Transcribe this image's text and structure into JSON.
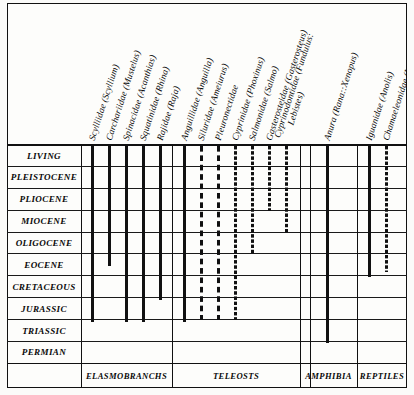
{
  "figure": {
    "type": "range-chart",
    "ink_color": "#111111",
    "paper_color": "#fdfdfb"
  },
  "rows": [
    {
      "id": "living",
      "label": "LIVING"
    },
    {
      "id": "pleistocene",
      "label": "PLEISTOCENE"
    },
    {
      "id": "pliocene",
      "label": "PLIOCENE"
    },
    {
      "id": "miocene",
      "label": "MIOCENE"
    },
    {
      "id": "oligocene",
      "label": "OLIGOCENE"
    },
    {
      "id": "eocene",
      "label": "EOCENE"
    },
    {
      "id": "cretaceous",
      "label": "CRETACEOUS"
    },
    {
      "id": "jurassic",
      "label": "JURASSIC"
    },
    {
      "id": "triassic",
      "label": "TRIASSIC"
    },
    {
      "id": "permian",
      "label": "PERMIAN"
    }
  ],
  "groups": [
    {
      "id": "elasmobranchs",
      "label": "ELASMOBRANCHS",
      "left": 81,
      "right": 172
    },
    {
      "id": "teleosts",
      "label": "TELEOSTS",
      "left": 172,
      "right": 300
    },
    {
      "id": "amphibia",
      "label": "AMPHIBIA",
      "left": 300,
      "right": 357
    },
    {
      "id": "reptiles",
      "label": "REPTILES",
      "left": 357,
      "right": 407
    }
  ],
  "taxa": [
    {
      "id": "scylliidae",
      "line1": "Scylliidae (Scyllium)",
      "line2": "",
      "x": 91,
      "group": "elasmobranchs",
      "style": "solid",
      "top": 146,
      "bottom": 322
    },
    {
      "id": "carchariidae",
      "line1": "Carchariidae (Mustelus)",
      "line2": "",
      "x": 108,
      "group": "elasmobranchs",
      "style": "solid",
      "top": 146,
      "bottom": 266
    },
    {
      "id": "spinacidae",
      "line1": "Spinacidae (Acanthias)",
      "line2": "",
      "x": 125,
      "group": "elasmobranchs",
      "style": "solid",
      "top": 146,
      "bottom": 322
    },
    {
      "id": "squatinidae",
      "line1": "Squatinidae (Rhina)",
      "line2": "",
      "x": 142,
      "group": "elasmobranchs",
      "style": "solid",
      "top": 146,
      "bottom": 322
    },
    {
      "id": "rajidae",
      "line1": "Rajidae (Raja)",
      "line2": "",
      "x": 159,
      "group": "elasmobranchs",
      "style": "solid",
      "top": 146,
      "bottom": 300
    },
    {
      "id": "anguillidae",
      "line1": "Anguillidae (Anguilla)",
      "line2": "",
      "x": 183,
      "group": "teleosts",
      "style": "solid",
      "top": 146,
      "bottom": 322
    },
    {
      "id": "siluridae",
      "line1": "Siluridae (Ameiurus)",
      "line2": "",
      "x": 200,
      "group": "teleosts",
      "style": "dashed-wide",
      "top": 146,
      "bottom": 320
    },
    {
      "id": "pleuronectidae",
      "line1": "Pleuronectidae",
      "line2": "",
      "x": 217,
      "group": "teleosts",
      "style": "dashed-wide",
      "top": 146,
      "bottom": 320
    },
    {
      "id": "cyprinidae",
      "line1": "Cyprinidae (Phoxinus)",
      "line2": "",
      "x": 234,
      "group": "teleosts",
      "style": "dashed",
      "top": 146,
      "bottom": 320
    },
    {
      "id": "salmonidae",
      "line1": "Salmonidae (Salmo)",
      "line2": "",
      "x": 251,
      "group": "teleosts",
      "style": "dashed",
      "top": 146,
      "bottom": 254
    },
    {
      "id": "gasterosteidae",
      "line1": "Gasterosteidae (Gasterosteus)",
      "line2": "",
      "x": 268,
      "group": "teleosts",
      "style": "dashed",
      "top": 146,
      "bottom": 211
    },
    {
      "id": "cyprinodontidae",
      "line1": "Cyprinodontidae (Fundulus:",
      "line2": "Lebistes)",
      "x": 285,
      "group": "teleosts",
      "style": "dashed",
      "top": 146,
      "bottom": 234
    },
    {
      "id": "anura",
      "line1": "Anura (Rana::Xenopus)",
      "line2": "",
      "x": 326,
      "group": "amphibia",
      "style": "solid",
      "top": 146,
      "bottom": 343
    },
    {
      "id": "iguanidae",
      "line1": "Iguanidae (Anolis)",
      "line2": "",
      "x": 368,
      "group": "reptiles",
      "style": "solid",
      "top": 146,
      "bottom": 277
    },
    {
      "id": "chamaeleonidae",
      "line1": "Chamaeleonidae (Lophosaura)",
      "line2": "",
      "x": 385,
      "group": "reptiles",
      "style": "dashed",
      "top": 146,
      "bottom": 272
    }
  ],
  "column_rules": [
    {
      "id": "elasmo-right",
      "x": 172
    },
    {
      "id": "teleost-right",
      "x": 300
    },
    {
      "id": "amphibia-right",
      "x": 357
    },
    {
      "id": "blank-1",
      "x": 172
    },
    {
      "id": "blank-2",
      "x": 310
    },
    {
      "id": "blank-3",
      "x": 357
    }
  ],
  "chart_data": {
    "type": "range-bars",
    "title": "",
    "xlabel": "",
    "ylabel": "Geological epoch",
    "categories": [
      "LIVING",
      "PLEISTOCENE",
      "PLIOCENE",
      "MIOCENE",
      "OLIGOCENE",
      "EOCENE",
      "CRETACEOUS",
      "JURASSIC",
      "TRIASSIC",
      "PERMIAN"
    ],
    "legend": [
      "solid = known fossil record",
      "dashed = inferred / fragmentary record"
    ],
    "series": [
      {
        "name": "Scylliidae (Scyllium)",
        "group": "ELASMOBRANCHS",
        "style": "solid",
        "from": "LIVING",
        "to": "CRETACEOUS"
      },
      {
        "name": "Carchariidae (Mustelus)",
        "group": "ELASMOBRANCHS",
        "style": "solid",
        "from": "LIVING",
        "to": "EOCENE"
      },
      {
        "name": "Spinacidae (Acanthias)",
        "group": "ELASMOBRANCHS",
        "style": "solid",
        "from": "LIVING",
        "to": "CRETACEOUS"
      },
      {
        "name": "Squatinidae (Rhina)",
        "group": "ELASMOBRANCHS",
        "style": "solid",
        "from": "LIVING",
        "to": "CRETACEOUS"
      },
      {
        "name": "Rajidae (Raja)",
        "group": "ELASMOBRANCHS",
        "style": "solid",
        "from": "LIVING",
        "to": "CRETACEOUS"
      },
      {
        "name": "Anguillidae (Anguilla)",
        "group": "TELEOSTS",
        "style": "solid",
        "from": "LIVING",
        "to": "CRETACEOUS"
      },
      {
        "name": "Siluridae (Ameiurus)",
        "group": "TELEOSTS",
        "style": "dashed",
        "from": "LIVING",
        "to": "CRETACEOUS"
      },
      {
        "name": "Pleuronectidae",
        "group": "TELEOSTS",
        "style": "dashed",
        "from": "LIVING",
        "to": "CRETACEOUS"
      },
      {
        "name": "Cyprinidae (Phoxinus)",
        "group": "TELEOSTS",
        "style": "dashed",
        "from": "LIVING",
        "to": "CRETACEOUS"
      },
      {
        "name": "Salmonidae (Salmo)",
        "group": "TELEOSTS",
        "style": "dashed",
        "from": "LIVING",
        "to": "OLIGOCENE"
      },
      {
        "name": "Gasterosteidae (Gasterosteus)",
        "group": "TELEOSTS",
        "style": "dashed",
        "from": "LIVING",
        "to": "PLIOCENE"
      },
      {
        "name": "Cyprinodontidae (Fundulus: Lebistes)",
        "group": "TELEOSTS",
        "style": "dashed",
        "from": "LIVING",
        "to": "MIOCENE"
      },
      {
        "name": "Anura (Rana::Xenopus)",
        "group": "AMPHIBIA",
        "style": "solid",
        "from": "LIVING",
        "to": "JURASSIC"
      },
      {
        "name": "Iguanidae (Anolis)",
        "group": "REPTILES",
        "style": "solid",
        "from": "LIVING",
        "to": "EOCENE"
      },
      {
        "name": "Chamaeleonidae (Lophosaura)",
        "group": "REPTILES",
        "style": "dashed",
        "from": "LIVING",
        "to": "EOCENE"
      }
    ]
  }
}
